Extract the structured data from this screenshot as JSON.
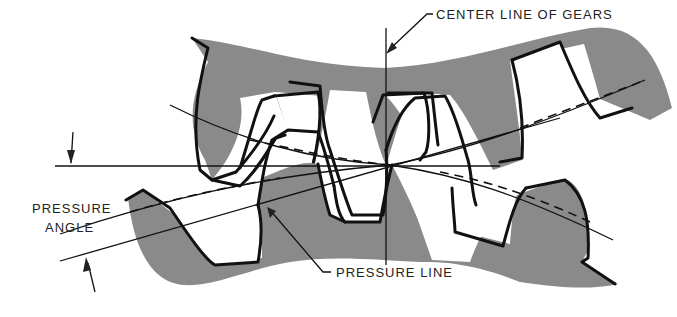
{
  "diagram": {
    "labels": {
      "center_line": "CENTER LINE OF GEARS",
      "pressure_angle_line1": "PRESSURE",
      "pressure_angle_line2": "ANGLE",
      "pressure_line": "PRESSURE LINE"
    },
    "colors": {
      "gear_fill": "#8a8a8a",
      "outline": "#111111",
      "background": "#ffffff"
    },
    "elements": [
      "upper-gear",
      "lower-gear",
      "center-line",
      "pressure-line",
      "pitch-circle-upper",
      "pitch-circle-lower",
      "horizontal-reference-line",
      "pressure-angle-arrows"
    ]
  }
}
